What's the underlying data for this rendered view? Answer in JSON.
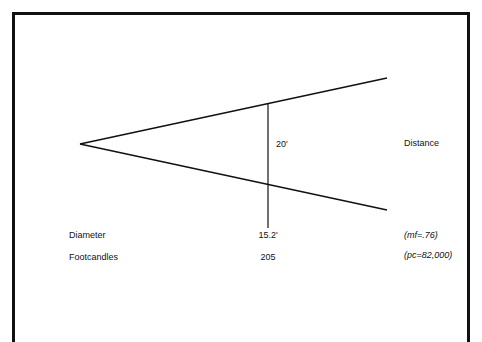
{
  "diagram": {
    "distance_value": "20'",
    "distance_label": "Distance",
    "rows": [
      {
        "label": "Diameter",
        "value": "15.2'",
        "note": "(mf=.76)"
      },
      {
        "label": "Footcandles",
        "value": "205",
        "note": "(pc=82,000)"
      }
    ],
    "colors": {
      "line": "#111111",
      "background": "#ffffff"
    }
  }
}
